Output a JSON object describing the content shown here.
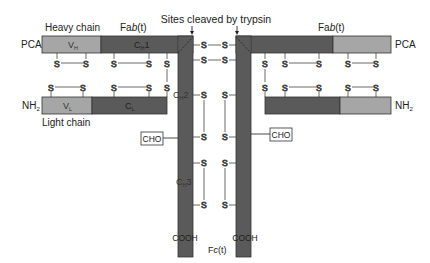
{
  "title": "Sites cleaved by trypsin",
  "colors": {
    "constant_region": "#5a5a5a",
    "variable_region": "#a6a6a6",
    "outline": "#333333",
    "line": "#444444",
    "text": "#222222"
  },
  "left": {
    "heavy_chain_label": "Heavy chain",
    "light_chain_label": "Light chain",
    "fab_label_prefix": "Fa",
    "fab_label_italic": "b",
    "fab_label_suffix": "(t)",
    "heavy_n_terminus": "PCA",
    "light_n_terminus": "NH",
    "light_n_terminus_sub": "2",
    "vh_label": "V",
    "vh_sub": "H",
    "ch1_label": "C",
    "ch1_sub": "H",
    "ch1_num": "1",
    "vl_label": "V",
    "vl_sub": "L",
    "cl_label": "C",
    "cl_sub": "L",
    "ch2_label": "C",
    "ch2_sub": "H",
    "ch2_num": "2",
    "ch3_label": "C",
    "ch3_sub": "H",
    "ch3_num": "3",
    "cho_label": "CHO",
    "c_terminus": "COOH"
  },
  "right": {
    "fab_label_prefix": "Fa",
    "fab_label_italic": "b",
    "fab_label_suffix": "(t)",
    "heavy_n_terminus": "PCA",
    "light_n_terminus": "NH",
    "light_n_terminus_sub": "2",
    "cho_label": "CHO",
    "c_terminus": "COOH"
  },
  "fc_label_prefix": "F",
  "fc_label_italic": "c",
  "fc_label_suffix": "(t)",
  "disulfide_symbol": "S"
}
